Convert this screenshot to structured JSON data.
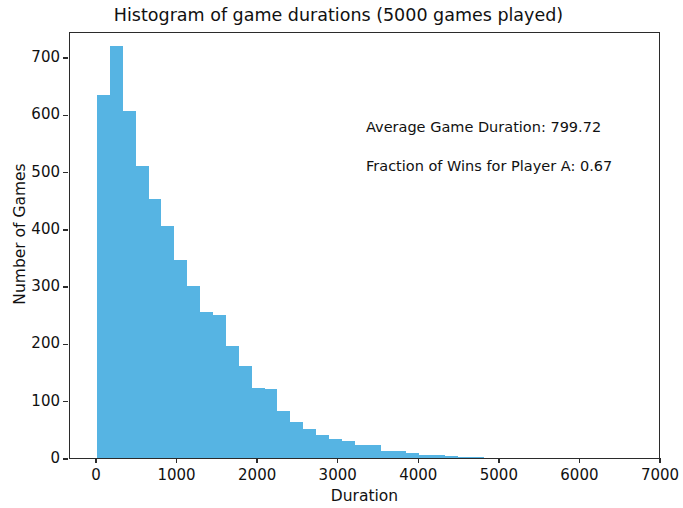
{
  "chart_data": {
    "type": "bar",
    "title": "Histogram of game durations (5000 games played)",
    "xlabel": "Duration",
    "ylabel": "Number of Games",
    "xlim": [
      0,
      7000
    ],
    "ylim": [
      0,
      760
    ],
    "grid": false,
    "legend": null,
    "bar_color": "#56B4E3",
    "bin_width": 160,
    "xticks": [
      0,
      1000,
      2000,
      3000,
      4000,
      5000,
      6000,
      7000
    ],
    "xtick_labels": [
      "0",
      "1000",
      "2000",
      "3000",
      "4000",
      "5000",
      "6000",
      "7000"
    ],
    "yticks": [
      0,
      100,
      200,
      300,
      400,
      500,
      600,
      700
    ],
    "ytick_labels": [
      "0",
      "100",
      "200",
      "300",
      "400",
      "500",
      "600",
      "700"
    ],
    "bin_starts": [
      0,
      160,
      320,
      480,
      640,
      800,
      960,
      1120,
      1280,
      1440,
      1600,
      1760,
      1920,
      2080,
      2240,
      2400,
      2560,
      2720,
      2880,
      3040,
      3200,
      3360,
      3520,
      3680,
      3840,
      4000,
      4160,
      4320,
      4480,
      4640
    ],
    "values": [
      633,
      720,
      605,
      510,
      452,
      405,
      345,
      300,
      255,
      250,
      195,
      160,
      122,
      120,
      82,
      62,
      50,
      40,
      33,
      30,
      22,
      22,
      13,
      12,
      8,
      6,
      5,
      3,
      2,
      1
    ],
    "annotations": [
      "Average Game Duration: 799.72",
      "Fraction of Wins for Player A: 0.67"
    ]
  },
  "annotations": {
    "average_game_duration": "Average Game Duration: 799.72",
    "fraction_of_wins": "Fraction of Wins for Player A: 0.67"
  }
}
